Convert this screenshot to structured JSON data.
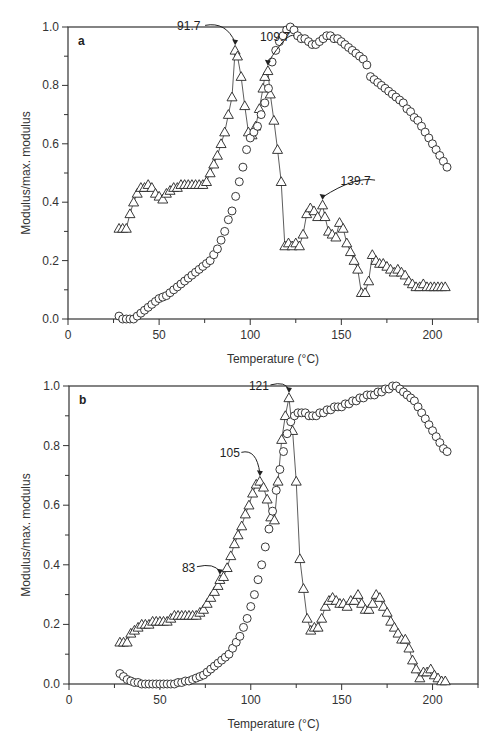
{
  "chart_data": [
    {
      "panel": "a",
      "type": "scatter",
      "title": "",
      "xlabel": "Temperature (°C)",
      "ylabel": "Modulus/max. modulus",
      "xlim": [
        0,
        225
      ],
      "ylim": [
        0,
        1.0
      ],
      "xticks": [
        0,
        50,
        100,
        150,
        200
      ],
      "yticks": [
        0.0,
        0.2,
        0.4,
        0.6,
        0.8,
        1.0
      ],
      "grid": false,
      "series": [
        {
          "name": "triangles (loss modulus, connected)",
          "marker": "triangle",
          "connected": true,
          "x": [
            28,
            30,
            32,
            34,
            36,
            38,
            40,
            42,
            44,
            46,
            48,
            50,
            52,
            54,
            56,
            58,
            60,
            62,
            64,
            66,
            68,
            70,
            72,
            74,
            76,
            78,
            80,
            82,
            84,
            86,
            88,
            90,
            91.7,
            93,
            95,
            97,
            99,
            101,
            103,
            105,
            107,
            108,
            109.7,
            111,
            113,
            115,
            117,
            119,
            121,
            123,
            125,
            127,
            129,
            131,
            133,
            135,
            137,
            139.7,
            141,
            143,
            145,
            147,
            149,
            151,
            153,
            155,
            157,
            159,
            161,
            163,
            165,
            167,
            169,
            171,
            173,
            175,
            177,
            179,
            181,
            183,
            185,
            187,
            189,
            191,
            193,
            195,
            197,
            199,
            201,
            203,
            205,
            207
          ],
          "y": [
            0.31,
            0.31,
            0.31,
            0.36,
            0.4,
            0.43,
            0.45,
            0.45,
            0.46,
            0.45,
            0.43,
            0.42,
            0.41,
            0.43,
            0.44,
            0.45,
            0.45,
            0.46,
            0.46,
            0.46,
            0.46,
            0.46,
            0.46,
            0.46,
            0.47,
            0.5,
            0.53,
            0.56,
            0.6,
            0.64,
            0.7,
            0.76,
            0.92,
            0.9,
            0.83,
            0.73,
            0.64,
            0.63,
            0.66,
            0.72,
            0.79,
            0.83,
            0.85,
            0.77,
            0.68,
            0.58,
            0.47,
            0.25,
            0.26,
            0.25,
            0.26,
            0.25,
            0.29,
            0.36,
            0.38,
            0.37,
            0.35,
            0.39,
            0.35,
            0.3,
            0.29,
            0.28,
            0.33,
            0.31,
            0.26,
            0.23,
            0.2,
            0.17,
            0.09,
            0.09,
            0.13,
            0.22,
            0.2,
            0.19,
            0.19,
            0.18,
            0.17,
            0.16,
            0.17,
            0.16,
            0.15,
            0.13,
            0.12,
            0.11,
            0.11,
            0.12,
            0.11,
            0.11,
            0.11,
            0.11,
            0.11,
            0.11
          ],
          "color": "#222222"
        },
        {
          "name": "circles (storage modulus)",
          "marker": "circle",
          "connected": false,
          "x": [
            28,
            30,
            32,
            34,
            36,
            38,
            40,
            42,
            44,
            46,
            48,
            50,
            52,
            54,
            56,
            58,
            60,
            62,
            64,
            66,
            68,
            70,
            72,
            74,
            76,
            78,
            80,
            82,
            84,
            86,
            88,
            90,
            92,
            94,
            96,
            98,
            100,
            102,
            104,
            106,
            108,
            110,
            112,
            114,
            116,
            118,
            120,
            122,
            124,
            126,
            128,
            130,
            132,
            134,
            136,
            138,
            140,
            142,
            144,
            146,
            148,
            150,
            152,
            154,
            156,
            158,
            160,
            162,
            164,
            166,
            168,
            170,
            172,
            174,
            176,
            178,
            180,
            182,
            184,
            186,
            188,
            190,
            192,
            194,
            196,
            198,
            200,
            202,
            204,
            206,
            208
          ],
          "y": [
            0.01,
            0.0,
            0.0,
            0.0,
            0.0,
            0.01,
            0.02,
            0.03,
            0.04,
            0.05,
            0.06,
            0.07,
            0.075,
            0.08,
            0.09,
            0.1,
            0.11,
            0.12,
            0.13,
            0.14,
            0.15,
            0.16,
            0.17,
            0.18,
            0.19,
            0.2,
            0.22,
            0.24,
            0.27,
            0.3,
            0.34,
            0.37,
            0.42,
            0.47,
            0.52,
            0.58,
            0.62,
            0.64,
            0.66,
            0.7,
            0.74,
            0.79,
            0.88,
            0.92,
            0.95,
            0.97,
            0.99,
            1.0,
            0.99,
            0.97,
            0.96,
            0.96,
            0.95,
            0.94,
            0.94,
            0.95,
            0.96,
            0.97,
            0.97,
            0.96,
            0.96,
            0.95,
            0.94,
            0.93,
            0.92,
            0.91,
            0.9,
            0.89,
            0.87,
            0.83,
            0.82,
            0.81,
            0.8,
            0.79,
            0.78,
            0.77,
            0.76,
            0.75,
            0.74,
            0.72,
            0.71,
            0.69,
            0.68,
            0.66,
            0.64,
            0.62,
            0.6,
            0.58,
            0.56,
            0.54,
            0.52
          ],
          "color": "#222222"
        }
      ],
      "annotations": [
        {
          "text": "91.7",
          "x": 91.7,
          "y": 0.92
        },
        {
          "text": "109.7",
          "x": 109.7,
          "y": 0.85
        },
        {
          "text": "139.7",
          "x": 139.7,
          "y": 0.39
        }
      ]
    },
    {
      "panel": "b",
      "type": "scatter",
      "title": "",
      "xlabel": "Temperature (°C)",
      "ylabel": "Modulus/max. modulus",
      "xlim": [
        0,
        225
      ],
      "ylim": [
        0,
        1.0
      ],
      "xticks": [
        0,
        50,
        100,
        150,
        200
      ],
      "yticks": [
        0.0,
        0.2,
        0.4,
        0.6,
        0.8,
        1.0
      ],
      "grid": false,
      "series": [
        {
          "name": "triangles (loss modulus, connected)",
          "marker": "triangle",
          "connected": true,
          "x": [
            28,
            30,
            32,
            34,
            36,
            38,
            40,
            42,
            44,
            46,
            48,
            50,
            52,
            54,
            56,
            58,
            60,
            62,
            64,
            66,
            68,
            70,
            72,
            74,
            76,
            78,
            80,
            82,
            83,
            85,
            87,
            89,
            91,
            93,
            95,
            97,
            99,
            101,
            103,
            105,
            107,
            109,
            111,
            113,
            115,
            117,
            119,
            121,
            123,
            125,
            127,
            129,
            131,
            133,
            135,
            137,
            139,
            141,
            143,
            145,
            147,
            149,
            151,
            153,
            155,
            157,
            159,
            161,
            163,
            165,
            167,
            169,
            171,
            173,
            175,
            177,
            179,
            181,
            183,
            185,
            187,
            189,
            191,
            193,
            195,
            197,
            199,
            201,
            203,
            205,
            207
          ],
          "y": [
            0.14,
            0.14,
            0.14,
            0.17,
            0.18,
            0.19,
            0.2,
            0.2,
            0.2,
            0.21,
            0.21,
            0.21,
            0.21,
            0.21,
            0.22,
            0.23,
            0.23,
            0.23,
            0.23,
            0.23,
            0.23,
            0.23,
            0.24,
            0.25,
            0.27,
            0.29,
            0.31,
            0.33,
            0.35,
            0.36,
            0.39,
            0.43,
            0.47,
            0.5,
            0.53,
            0.57,
            0.6,
            0.64,
            0.67,
            0.68,
            0.66,
            0.62,
            0.56,
            0.55,
            0.68,
            0.82,
            0.9,
            0.96,
            0.85,
            0.68,
            0.42,
            0.32,
            0.22,
            0.18,
            0.19,
            0.19,
            0.22,
            0.26,
            0.28,
            0.29,
            0.28,
            0.27,
            0.27,
            0.26,
            0.28,
            0.28,
            0.3,
            0.27,
            0.25,
            0.25,
            0.27,
            0.3,
            0.29,
            0.26,
            0.24,
            0.21,
            0.19,
            0.17,
            0.15,
            0.15,
            0.12,
            0.08,
            0.05,
            0.02,
            0.04,
            0.04,
            0.05,
            0.03,
            0.02,
            0.01,
            0.01
          ],
          "color": "#222222"
        },
        {
          "name": "circles (storage modulus)",
          "marker": "circle",
          "connected": false,
          "x": [
            28,
            30,
            32,
            34,
            36,
            38,
            40,
            42,
            44,
            46,
            48,
            50,
            52,
            54,
            56,
            58,
            60,
            62,
            64,
            66,
            68,
            70,
            72,
            74,
            76,
            78,
            80,
            82,
            84,
            86,
            88,
            90,
            92,
            94,
            96,
            98,
            100,
            102,
            104,
            106,
            108,
            110,
            112,
            114,
            116,
            118,
            120,
            122,
            124,
            126,
            128,
            130,
            132,
            134,
            136,
            138,
            140,
            142,
            144,
            146,
            148,
            150,
            152,
            154,
            156,
            158,
            160,
            162,
            164,
            166,
            168,
            170,
            172,
            174,
            176,
            178,
            180,
            182,
            184,
            186,
            188,
            190,
            192,
            194,
            196,
            198,
            200,
            202,
            204,
            206,
            208
          ],
          "y": [
            0.035,
            0.025,
            0.015,
            0.01,
            0.005,
            0.005,
            0.0,
            0.0,
            0.0,
            0.0,
            0.0,
            0.0,
            0.0,
            0.0,
            0.0,
            0.0,
            0.005,
            0.005,
            0.01,
            0.01,
            0.015,
            0.02,
            0.025,
            0.03,
            0.04,
            0.05,
            0.06,
            0.07,
            0.08,
            0.09,
            0.1,
            0.12,
            0.14,
            0.16,
            0.19,
            0.22,
            0.26,
            0.3,
            0.35,
            0.4,
            0.46,
            0.52,
            0.58,
            0.65,
            0.72,
            0.78,
            0.84,
            0.88,
            0.9,
            0.91,
            0.91,
            0.91,
            0.9,
            0.9,
            0.9,
            0.91,
            0.91,
            0.92,
            0.92,
            0.93,
            0.93,
            0.93,
            0.94,
            0.94,
            0.95,
            0.95,
            0.96,
            0.96,
            0.97,
            0.97,
            0.97,
            0.98,
            0.98,
            0.99,
            0.99,
            1.0,
            1.0,
            0.99,
            0.98,
            0.97,
            0.96,
            0.95,
            0.93,
            0.91,
            0.89,
            0.87,
            0.85,
            0.83,
            0.81,
            0.79,
            0.78
          ],
          "color": "#222222"
        }
      ],
      "annotations": [
        {
          "text": "83",
          "x": 83,
          "y": 0.35
        },
        {
          "text": "105",
          "x": 105,
          "y": 0.68
        },
        {
          "text": "121",
          "x": 121,
          "y": 0.96
        }
      ]
    }
  ],
  "panels": {
    "a": {
      "label": "a",
      "xlabel": "Temperature (°C)",
      "ylabel": "Modulus/max. modulus"
    },
    "b": {
      "label": "b",
      "xlabel": "Temperature (°C)",
      "ylabel": "Modulus/max. modulus"
    }
  }
}
